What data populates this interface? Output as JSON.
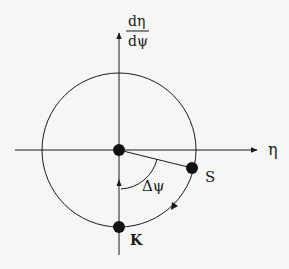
{
  "diagram": {
    "y_axis_label_numerator": "dη",
    "y_axis_label_denominator": "dψ",
    "x_axis_label": "η",
    "point_s_label": "S",
    "point_k_label": "K",
    "angle_label": "Δψ",
    "colors": {
      "ink": "#1a1a1a",
      "background": "#f6f6f4"
    }
  }
}
